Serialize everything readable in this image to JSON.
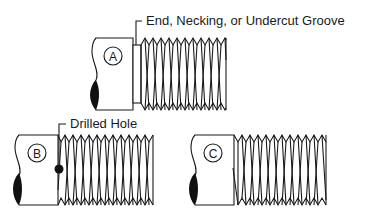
{
  "figure": {
    "colors": {
      "stroke": "#1a1a1a",
      "fill": "#ffffff",
      "solid": "#111111"
    }
  },
  "parts": [
    {
      "id": "A",
      "label": "A",
      "callout": "End, Necking, or Undercut Groove",
      "feature": "undercut-groove"
    },
    {
      "id": "B",
      "label": "B",
      "callout": "Drilled Hole",
      "feature": "drilled-hole"
    },
    {
      "id": "C",
      "label": "C",
      "callout": "",
      "feature": "thread-runout"
    }
  ]
}
